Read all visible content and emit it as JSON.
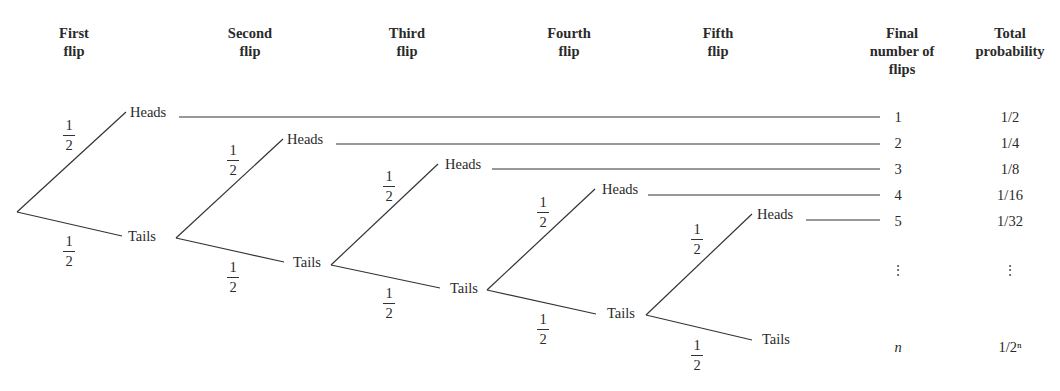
{
  "headers": {
    "first": [
      "First",
      "flip"
    ],
    "second": [
      "Second",
      "flip"
    ],
    "third": [
      "Third",
      "flip"
    ],
    "fourth": [
      "Fourth",
      "flip"
    ],
    "fifth": [
      "Fifth",
      "flip"
    ],
    "final": [
      "Final",
      "number of",
      "flips"
    ],
    "total": [
      "Total",
      "probability"
    ]
  },
  "outcome_labels": {
    "heads": "Heads",
    "tails": "Tails"
  },
  "branch_probability": {
    "numerator": "1",
    "denominator": "2"
  },
  "rows": [
    {
      "flips": "1",
      "probability": "1/2"
    },
    {
      "flips": "2",
      "probability": "1/4"
    },
    {
      "flips": "3",
      "probability": "1/8"
    },
    {
      "flips": "4",
      "probability": "1/16"
    },
    {
      "flips": "5",
      "probability": "1/32"
    },
    {
      "flips": "⋮",
      "probability": "⋮"
    },
    {
      "flips": "n",
      "probability": "1/2ⁿ"
    }
  ]
}
